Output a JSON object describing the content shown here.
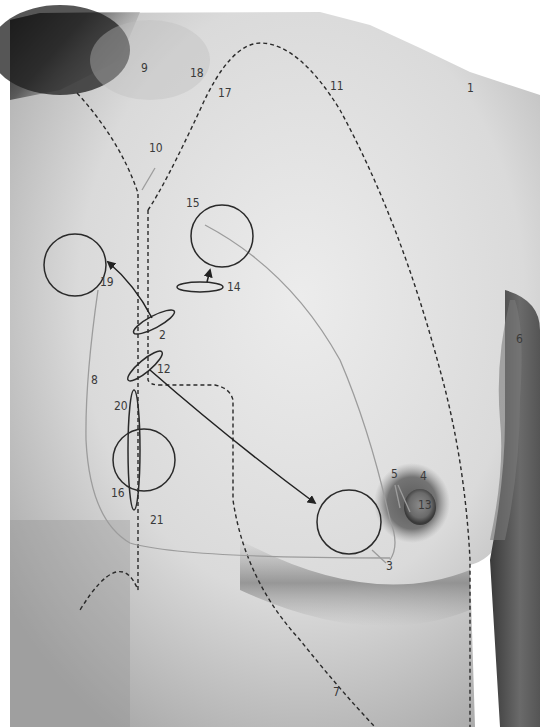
{
  "figure": {
    "labels": [
      {
        "id": "1",
        "text": "1",
        "x": 467,
        "y": 92
      },
      {
        "id": "2",
        "text": "2",
        "x": 159,
        "y": 339
      },
      {
        "id": "3",
        "text": "3",
        "x": 386,
        "y": 570
      },
      {
        "id": "4",
        "text": "4",
        "x": 420,
        "y": 480
      },
      {
        "id": "5",
        "text": "5",
        "x": 391,
        "y": 478
      },
      {
        "id": "6",
        "text": "6",
        "x": 516,
        "y": 343
      },
      {
        "id": "7",
        "text": "7",
        "x": 333,
        "y": 696
      },
      {
        "id": "8",
        "text": "8",
        "x": 91,
        "y": 384
      },
      {
        "id": "9",
        "text": "9",
        "x": 141,
        "y": 72
      },
      {
        "id": "10",
        "text": "10",
        "x": 149,
        "y": 152
      },
      {
        "id": "11",
        "text": "11",
        "x": 330,
        "y": 90
      },
      {
        "id": "12",
        "text": "12",
        "x": 157,
        "y": 373
      },
      {
        "id": "13",
        "text": "13",
        "x": 418,
        "y": 509
      },
      {
        "id": "14",
        "text": "14",
        "x": 227,
        "y": 291
      },
      {
        "id": "15",
        "text": "15",
        "x": 186,
        "y": 207
      },
      {
        "id": "16",
        "text": "16",
        "x": 111,
        "y": 497
      },
      {
        "id": "17",
        "text": "17",
        "x": 218,
        "y": 97
      },
      {
        "id": "18",
        "text": "18",
        "x": 190,
        "y": 77
      },
      {
        "id": "19",
        "text": "19",
        "x": 100,
        "y": 286
      },
      {
        "id": "20",
        "text": "20",
        "x": 114,
        "y": 410
      },
      {
        "id": "21",
        "text": "21",
        "x": 150,
        "y": 524
      }
    ],
    "colors": {
      "skin_light": "#e6e6e6",
      "skin_mid": "#c9c9c9",
      "shadow": "#4a4a4a",
      "annotation": "#2a2a2a",
      "guide_line": "#9a9a9a",
      "areola": "#6e6e6e"
    }
  }
}
